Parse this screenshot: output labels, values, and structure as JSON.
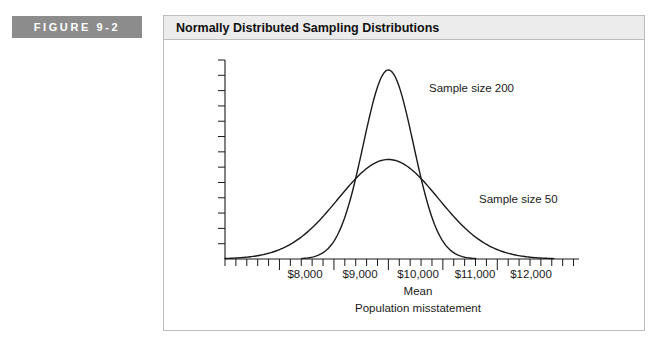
{
  "figure": {
    "tab_label": "FIGURE 9-2",
    "title": "Normally Distributed Sampling Distributions",
    "tab_color": "#8c8c8c",
    "title_bar_color": "#ececec",
    "border_color": "#bdbdbd",
    "ink_color": "#1a1a1a"
  },
  "chart_data": {
    "type": "line",
    "title": "Normally Distributed Sampling Distributions",
    "xlabel": "Mean",
    "xlabel_secondary": "Population misstatement",
    "ylabel": "",
    "grid": false,
    "legend_position": "inline-annotation",
    "xlim": [
      7000,
      13500
    ],
    "ylim": [
      0,
      1.0
    ],
    "xtick_labels": [
      "$8,000",
      "$9,000",
      "$10,000",
      "$11,000",
      "$12,000"
    ],
    "xtick_values": [
      8000,
      9000,
      10000,
      11000,
      12000
    ],
    "minor_ticks_per_interval": 5,
    "yaxis_tick_count": 13,
    "mean": 10000,
    "annotations": [
      {
        "text": "Sample size 200",
        "target_series": "Sample size 200"
      },
      {
        "text": "Sample size 50",
        "target_series": "Sample size 50"
      }
    ],
    "series": [
      {
        "name": "Sample size 200",
        "mean": 10000,
        "std": 460,
        "peak_height": 0.95,
        "x": [
          8400,
          8700,
          9000,
          9200,
          9400,
          9600,
          9800,
          10000,
          10200,
          10400,
          10600,
          10800,
          11000,
          11300,
          11600
        ],
        "values": [
          0.0,
          0.01,
          0.04,
          0.11,
          0.25,
          0.5,
          0.8,
          0.95,
          0.8,
          0.5,
          0.25,
          0.11,
          0.04,
          0.01,
          0.0
        ]
      },
      {
        "name": "Sample size 50",
        "mean": 10000,
        "std": 920,
        "peak_height": 0.5,
        "x": [
          7300,
          7800,
          8200,
          8600,
          9000,
          9400,
          9700,
          10000,
          10300,
          10600,
          11000,
          11400,
          11800,
          12300,
          12900
        ],
        "values": [
          0.0,
          0.02,
          0.05,
          0.12,
          0.22,
          0.36,
          0.46,
          0.5,
          0.46,
          0.36,
          0.22,
          0.12,
          0.05,
          0.02,
          0.0
        ]
      }
    ]
  }
}
